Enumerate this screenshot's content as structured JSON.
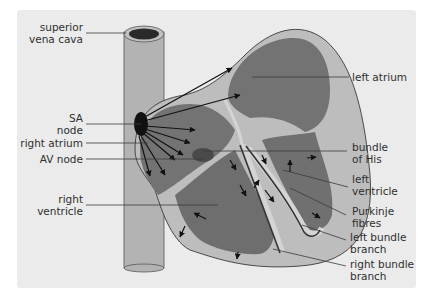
{
  "figure": {
    "colors": {
      "panel_background": "#ebebeb",
      "outer_wall": "#b8b8b8",
      "chamber_fill": "#737373",
      "septum_light": "#cfcfcf",
      "node_fill": "#111111",
      "av_node_fill": "#4a4a4a",
      "leader_line": "#3a3a3a",
      "label_text": "#2f2f2f"
    }
  },
  "labels": {
    "left": [
      {
        "id": "superior_vena_cava",
        "line1": "superior",
        "line2": "vena cava"
      },
      {
        "id": "sa_node",
        "line1": "SA",
        "line2": "node"
      },
      {
        "id": "right_atrium",
        "line1": "right atrium",
        "line2": ""
      },
      {
        "id": "av_node",
        "line1": "AV node",
        "line2": ""
      },
      {
        "id": "right_ventricle",
        "line1": "right",
        "line2": "ventricle"
      }
    ],
    "right": [
      {
        "id": "left_atrium",
        "line1": "left atrium",
        "line2": ""
      },
      {
        "id": "bundle_of_his",
        "line1": "bundle",
        "line2": "of His"
      },
      {
        "id": "left_ventricle",
        "line1": "left",
        "line2": "ventricle"
      },
      {
        "id": "purkinje_fibres",
        "line1": "Purkinje",
        "line2": "fibres"
      },
      {
        "id": "left_bundle_branch",
        "line1": "left bundle",
        "line2": "branch"
      },
      {
        "id": "right_bundle_branch",
        "line1": "right bundle",
        "line2": "branch"
      }
    ]
  }
}
